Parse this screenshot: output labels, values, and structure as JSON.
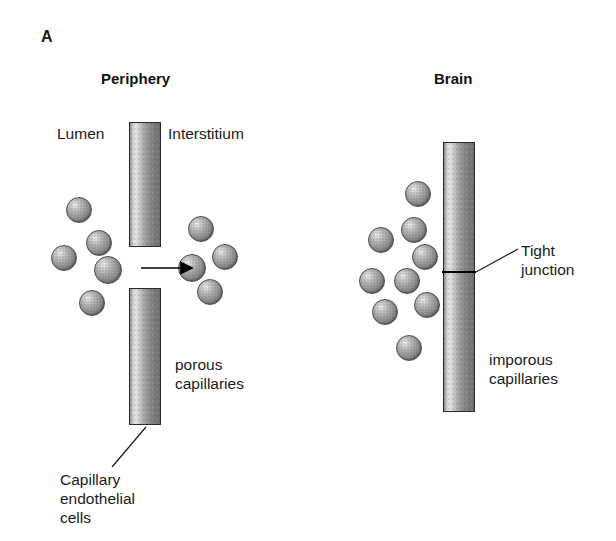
{
  "figure": {
    "panel_letter": "A",
    "width": 616,
    "height": 541,
    "background_color": "#ffffff",
    "ink_color": "#1a1a1a"
  },
  "panels": {
    "periphery": {
      "title": "Periphery",
      "labels": {
        "lumen": "Lumen",
        "interstitium": "Interstitium",
        "capillary_type_line1": "porous",
        "capillary_type_line2": "capillaries",
        "endothelium_line1": "Capillary",
        "endothelium_line2": "endothelial",
        "endothelium_line3": "cells"
      },
      "capillary_segments": [
        {
          "name": "upper-endothelial-cell",
          "x": 129,
          "y": 122,
          "w": 32,
          "h": 125
        },
        {
          "name": "lower-endothelial-cell",
          "x": 129,
          "y": 288,
          "w": 32,
          "h": 137
        }
      ],
      "fenestration_gap": {
        "y_top": 247,
        "y_bottom": 288
      },
      "flow_arrow": {
        "x1": 141,
        "y1": 268,
        "x2": 186,
        "y2": 268,
        "direction": "left-to-right"
      },
      "lumen_molecules": [
        {
          "cx": 79,
          "cy": 210,
          "r": 13
        },
        {
          "cx": 99,
          "cy": 243,
          "r": 13
        },
        {
          "cx": 64,
          "cy": 258,
          "r": 13
        },
        {
          "cx": 108,
          "cy": 270,
          "r": 14
        },
        {
          "cx": 92,
          "cy": 303,
          "r": 13
        }
      ],
      "interstitium_molecules": [
        {
          "cx": 201,
          "cy": 229,
          "r": 13
        },
        {
          "cx": 192,
          "cy": 268,
          "r": 14
        },
        {
          "cx": 225,
          "cy": 257,
          "r": 13
        },
        {
          "cx": 210,
          "cy": 292,
          "r": 13
        }
      ]
    },
    "brain": {
      "title": "Brain",
      "labels": {
        "tight_junction_line1": "Tight",
        "tight_junction_line2": "junction",
        "capillary_type_line1": "imporous",
        "capillary_type_line2": "capillaries"
      },
      "capillary_segments": [
        {
          "name": "continuous-endothelium",
          "x": 443,
          "y": 142,
          "w": 32,
          "h": 270
        }
      ],
      "tight_junction": {
        "x1": 443,
        "y": 272,
        "x2": 475
      },
      "lumen_molecules": [
        {
          "cx": 418,
          "cy": 194,
          "r": 13
        },
        {
          "cx": 414,
          "cy": 230,
          "r": 13
        },
        {
          "cx": 381,
          "cy": 240,
          "r": 13
        },
        {
          "cx": 425,
          "cy": 257,
          "r": 13
        },
        {
          "cx": 407,
          "cy": 281,
          "r": 13
        },
        {
          "cx": 372,
          "cy": 281,
          "r": 13
        },
        {
          "cx": 427,
          "cy": 305,
          "r": 13
        },
        {
          "cx": 385,
          "cy": 312,
          "r": 13
        },
        {
          "cx": 409,
          "cy": 348,
          "r": 13
        }
      ]
    }
  },
  "leader_lines": [
    {
      "name": "endothelial-cells-leader",
      "x1": 146,
      "y1": 428,
      "x2": 112,
      "y2": 468
    },
    {
      "name": "tight-junction-leader",
      "x1": 476,
      "y1": 272,
      "x2": 518,
      "y2": 250
    }
  ]
}
